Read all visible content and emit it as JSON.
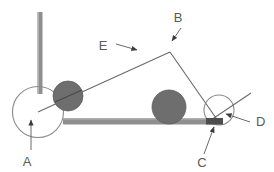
{
  "figure": {
    "type": "mechanical-linkage-diagram",
    "background_color": "#ffffff",
    "line_color": "#5a5a5a",
    "post_color": "#8f8f8f",
    "bar_color": "#8f8f8f",
    "disc_fill": "#6e6e6e",
    "wheel_stroke": "#8a8a8a",
    "width": 274,
    "height": 172
  },
  "labels": {
    "a": "A",
    "b": "B",
    "c": "C",
    "d": "D",
    "e": "E"
  },
  "parts": {
    "vertical_post": {
      "x": 38,
      "y_top": 12,
      "y_bottom": 93,
      "width": 5
    },
    "ground_bar": {
      "x_left": 63,
      "x_right": 223,
      "y_top": 118,
      "height": 6
    },
    "left_wheel": {
      "cx": 38,
      "cy": 112,
      "r": 25,
      "style": "outline"
    },
    "left_disc": {
      "cx": 68,
      "cy": 96,
      "r": 15,
      "style": "filled"
    },
    "middle_disc": {
      "cx": 169,
      "cy": 108,
      "r": 17,
      "style": "filled"
    },
    "right_wheel": {
      "cx": 219,
      "cy": 110,
      "r": 15,
      "style": "outline"
    },
    "link_apex": {
      "x": 170,
      "y": 52
    }
  },
  "annotations": {
    "a_arrow": {
      "from_x": 31,
      "from_y": 150,
      "to_x": 31,
      "to_y": 118,
      "label_x": 27,
      "label_y": 165
    },
    "b_arrow": {
      "from_x": 180,
      "from_y": 28,
      "to_x": 171,
      "to_y": 43,
      "label_x": 175,
      "label_y": 21
    },
    "c_arrow": {
      "from_x": 203,
      "from_y": 155,
      "to_x": 214,
      "to_y": 124,
      "label_x": 200,
      "label_y": 166
    },
    "d_arrow": {
      "from_x": 250,
      "from_y": 122,
      "to_x": 224,
      "to_y": 116,
      "label_x": 256,
      "label_y": 125
    },
    "e_arrow": {
      "from_x": 117,
      "from_y": 45,
      "to_x": 140,
      "to_y": 50,
      "label_x": 103,
      "label_y": 49
    }
  }
}
